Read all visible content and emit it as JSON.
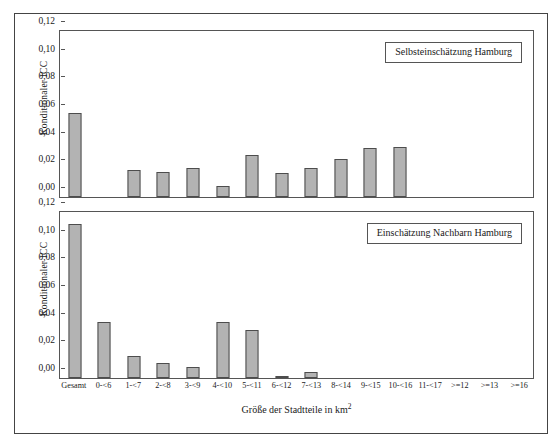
{
  "axes": {
    "ylabel": "Konditionaler ICC",
    "xlabel": "Größe der Stadtteile in km²",
    "yticks": [
      "0,00",
      "0,02",
      "0,04",
      "0,06",
      "0,08",
      "0,10",
      "0,12"
    ],
    "ymin": 0,
    "ymax": 0.12
  },
  "panels": [
    {
      "legend": "Selbsteinschätzung Hamburg"
    },
    {
      "legend": "Einschätzung Nachbarn Hamburg"
    }
  ],
  "colors": {
    "bar_fill": "#b3b3b3",
    "bar_stroke": "#4d4d4d",
    "frame": "#555555",
    "text": "#1a1a1a"
  },
  "chart_data": [
    {
      "type": "bar",
      "title": "Selbsteinschätzung Hamburg",
      "xlabel": "Größe der Stadtteile in km²",
      "ylabel": "Konditionaler ICC",
      "ylim": [
        0,
        0.12
      ],
      "yticks": [
        0,
        0.02,
        0.04,
        0.06,
        0.08,
        0.1,
        0.12
      ],
      "grid": false,
      "legend": "inside-top-right",
      "categories": [
        "Gesamt",
        "0-<6",
        "1-<7",
        "2-<8",
        "3-<9",
        "4-<10",
        "5-<11",
        "6-<12",
        "7-<13",
        "8-<14",
        "9-<15",
        "10-<16",
        "11-<17",
        ">=12",
        ">=13",
        ">=16"
      ],
      "values": [
        0.06,
        0.0,
        0.019,
        0.018,
        0.021,
        0.008,
        0.03,
        0.017,
        0.021,
        0.027,
        0.035,
        0.036,
        0.0,
        0.0,
        0.0,
        0.0
      ]
    },
    {
      "type": "bar",
      "title": "Einschätzung Nachbarn Hamburg",
      "xlabel": "Größe der Stadtteile in km²",
      "ylabel": "Konditionaler ICC",
      "ylim": [
        0,
        0.12
      ],
      "yticks": [
        0,
        0.02,
        0.04,
        0.06,
        0.08,
        0.1,
        0.12
      ],
      "grid": false,
      "legend": "inside-top-right",
      "categories": [
        "Gesamt",
        "0-<6",
        "1-<7",
        "2-<8",
        "3-<9",
        "4-<10",
        "5-<11",
        "6-<12",
        "7-<13",
        "8-<14",
        "9-<15",
        "10-<16",
        "11-<17",
        ">=12",
        ">=13",
        ">=16"
      ],
      "values": [
        0.11,
        0.04,
        0.016,
        0.011,
        0.008,
        0.04,
        0.034,
        0.001,
        0.004,
        0.0,
        0.0,
        0.0,
        0.0,
        0.0,
        0.0,
        0.0
      ]
    }
  ]
}
